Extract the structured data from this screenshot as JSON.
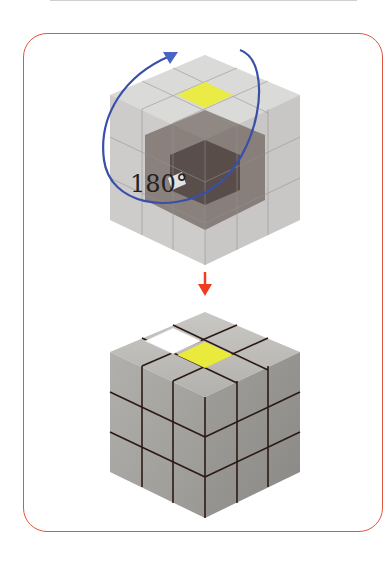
{
  "figure": {
    "type": "rubiks-cube-rotation-diagram",
    "rotation_label": "180°",
    "colors": {
      "frame_border": "#e2553f",
      "rotation_arrow": "#3a4fa8",
      "step_arrow": "#f03c1e",
      "highlight_yellow": "#eaea3c",
      "highlight_white": "#ffffff",
      "cube_gray": "#a8a6a3"
    },
    "top_cube": {
      "style": "transparent",
      "highlighted_sticker": "yellow"
    },
    "bottom_cube": {
      "style": "solid",
      "highlighted_stickers": [
        "white",
        "yellow"
      ]
    }
  }
}
